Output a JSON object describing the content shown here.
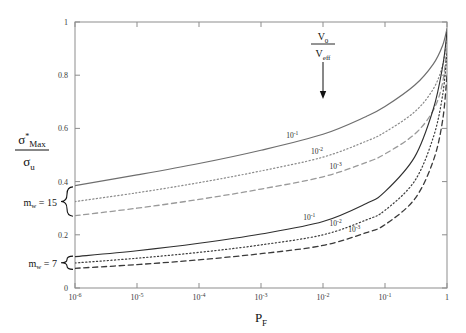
{
  "chart_data": {
    "type": "line",
    "title": "",
    "xlabel": "P_F",
    "xlabel_main": "P",
    "xlabel_sub": "F",
    "ylabel": "sigma*_Max / sigma_u",
    "ylabel_num_main": "σ",
    "ylabel_num_sup": "*",
    "ylabel_num_sub": "Max",
    "ylabel_den_main": "σ",
    "ylabel_den_sub": "u",
    "xscale": "log",
    "yscale": "linear",
    "xlim": [
      1e-06,
      1
    ],
    "ylim": [
      0,
      1
    ],
    "grid": false,
    "legend_position": "inline-curve-labels",
    "xticks": [
      {
        "value": 1e-06,
        "mantissa": "10",
        "exponent": "-6"
      },
      {
        "value": 1e-05,
        "mantissa": "10",
        "exponent": "-5"
      },
      {
        "value": 0.0001,
        "mantissa": "10",
        "exponent": "-4"
      },
      {
        "value": 0.001,
        "mantissa": "10",
        "exponent": "-3"
      },
      {
        "value": 0.01,
        "mantissa": "10",
        "exponent": "-2"
      },
      {
        "value": 0.1,
        "mantissa": "10",
        "exponent": "-1"
      },
      {
        "value": 1,
        "mantissa": "1",
        "exponent": ""
      }
    ],
    "yticks": [
      {
        "value": 0,
        "label": "0"
      },
      {
        "value": 0.2,
        "label": "0.2"
      },
      {
        "value": 0.4,
        "label": "0.4"
      },
      {
        "value": 0.6,
        "label": "0.6"
      },
      {
        "value": 0.8,
        "label": "0.8"
      },
      {
        "value": 1,
        "label": "1"
      }
    ],
    "annotations": [
      {
        "name": "v0-veff-annotation",
        "num_main": "V",
        "num_sub": "0",
        "den_main": "V",
        "den_sub": "eff",
        "x": 0.01,
        "arrow_to_y": 0.72
      },
      {
        "name": "mw-15-bracket-label",
        "main": "m",
        "sub": "w",
        "eq": "= 15",
        "y_top": 0.38,
        "y_bottom": 0.27
      },
      {
        "name": "mw-7-bracket-label",
        "main": "m",
        "sub": "w",
        "eq": "= 7",
        "y_top": 0.12,
        "y_bottom": 0.07
      }
    ],
    "series": [
      {
        "name": "mw15-1e-1",
        "group": "m_w = 15",
        "label_mantissa": "10",
        "label_exponent": "-1",
        "style": "solid",
        "color": "#6e6e6e",
        "width": 1.2,
        "label_x": 0.0032,
        "x": [
          1e-06,
          1e-05,
          0.0001,
          0.001,
          0.01,
          0.05,
          0.1,
          0.3,
          0.6,
          0.85,
          1
        ],
        "y": [
          0.385,
          0.425,
          0.468,
          0.518,
          0.578,
          0.645,
          0.682,
          0.762,
          0.842,
          0.912,
          0.975
        ]
      },
      {
        "name": "mw15-1e-2",
        "group": "m_w = 15",
        "label_mantissa": "10",
        "label_exponent": "-2",
        "style": "dotted",
        "color": "#8a8a8a",
        "width": 1.2,
        "label_x": 0.008,
        "x": [
          1e-06,
          1e-05,
          0.0001,
          0.001,
          0.01,
          0.05,
          0.1,
          0.3,
          0.6,
          0.85,
          1
        ],
        "y": [
          0.325,
          0.358,
          0.396,
          0.44,
          0.492,
          0.552,
          0.586,
          0.662,
          0.748,
          0.838,
          0.94
        ]
      },
      {
        "name": "mw15-1e-3",
        "group": "m_w = 15",
        "label_mantissa": "10",
        "label_exponent": "-3",
        "style": "dashed",
        "color": "#9a9a9a",
        "width": 1.3,
        "label_x": 0.016,
        "x": [
          1e-06,
          1e-05,
          0.0001,
          0.001,
          0.01,
          0.05,
          0.1,
          0.3,
          0.6,
          0.85,
          1
        ],
        "y": [
          0.272,
          0.3,
          0.333,
          0.372,
          0.418,
          0.472,
          0.504,
          0.578,
          0.668,
          0.772,
          0.91
        ]
      },
      {
        "name": "mw7-1e-1",
        "group": "m_w = 7",
        "label_mantissa": "10",
        "label_exponent": "-1",
        "style": "solid",
        "color": "#2f2f2f",
        "width": 1.1,
        "label_x": 0.006,
        "x": [
          1e-06,
          1e-05,
          0.0001,
          0.001,
          0.01,
          0.05,
          0.1,
          0.3,
          0.6,
          0.85,
          1
        ],
        "y": [
          0.118,
          0.14,
          0.168,
          0.203,
          0.25,
          0.318,
          0.362,
          0.492,
          0.672,
          0.832,
          0.962
        ]
      },
      {
        "name": "mw7-1e-2",
        "group": "m_w = 7",
        "label_mantissa": "10",
        "label_exponent": "-2",
        "style": "dotted",
        "color": "#3d3d3d",
        "width": 1.2,
        "label_x": 0.016,
        "x": [
          1e-06,
          1e-05,
          0.0001,
          0.001,
          0.01,
          0.05,
          0.1,
          0.3,
          0.6,
          0.85,
          1
        ],
        "y": [
          0.094,
          0.112,
          0.134,
          0.162,
          0.2,
          0.256,
          0.292,
          0.402,
          0.566,
          0.725,
          0.885
        ]
      },
      {
        "name": "mw7-1e-3",
        "group": "m_w = 7",
        "label_mantissa": "10",
        "label_exponent": "-3",
        "style": "dashed",
        "color": "#3a3a3a",
        "width": 1.3,
        "label_x": 0.032,
        "x": [
          1e-06,
          1e-05,
          0.0001,
          0.001,
          0.01,
          0.05,
          0.1,
          0.3,
          0.6,
          0.85,
          1
        ],
        "y": [
          0.074,
          0.088,
          0.106,
          0.129,
          0.16,
          0.208,
          0.238,
          0.334,
          0.478,
          0.63,
          0.8
        ]
      }
    ]
  }
}
